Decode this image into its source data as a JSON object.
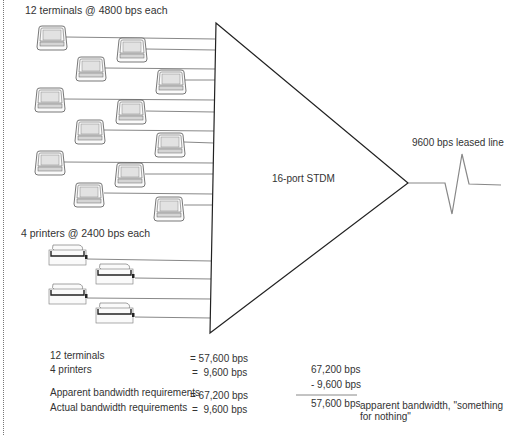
{
  "labels": {
    "terminals_heading": "12 terminals @ 4800 bps each",
    "printers_heading": "4 printers @ 2400 bps each",
    "mux": "16-port STDM",
    "line": "9600 bps leased line"
  },
  "devices": {
    "terminal_count": 12,
    "terminal_rate_bps": 4800,
    "printer_count": 4,
    "printer_rate_bps": 2400
  },
  "summary": {
    "rows": [
      {
        "label": "12 terminals",
        "value": "= 57,600 bps"
      },
      {
        "label": "4 printers",
        "value": "=  9,600 bps"
      },
      {
        "label": "Apparent bandwidth requirements",
        "value": "= 67,200 bps"
      },
      {
        "label": "Actual bandwidth requirements",
        "value": "=  9,600 bps"
      }
    ]
  },
  "calculation": {
    "line1": "67,200 bps",
    "line2": "- 9,600 bps",
    "result": "57,600 bps",
    "note_line1": "apparent bandwidth, \"something",
    "note_line2": "for nothing\""
  },
  "colors": {
    "line": "#888888",
    "outline": "#222222",
    "screen": "#e4e4e4"
  }
}
